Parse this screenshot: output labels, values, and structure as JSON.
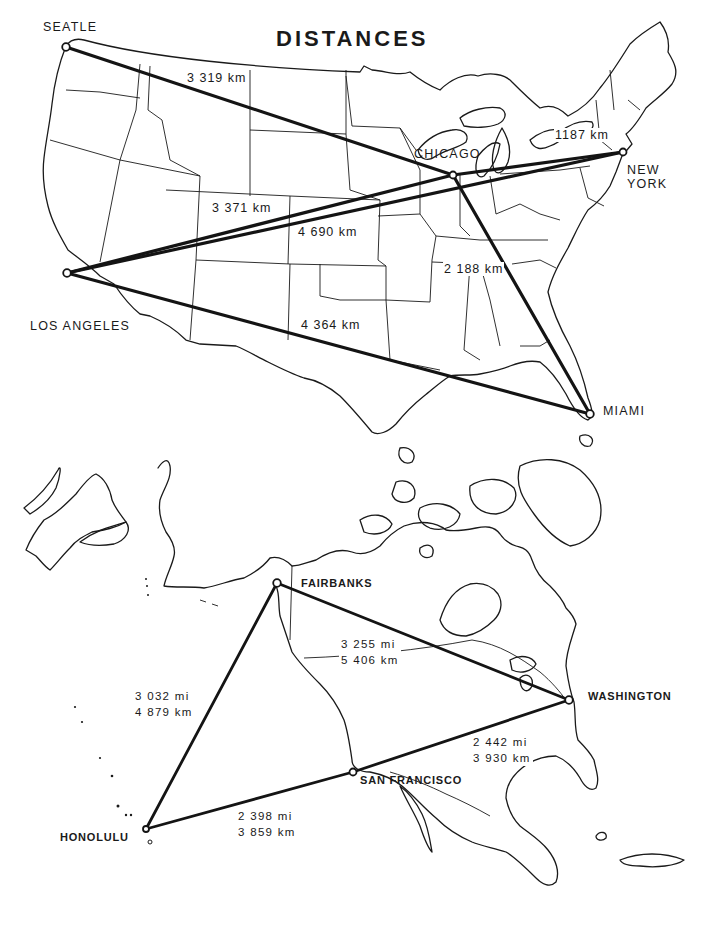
{
  "title": "DISTANCES",
  "us_map": {
    "cities": {
      "seattle": "SEATLE",
      "chicago": "CHICAGO",
      "new_york_line1": "NEW",
      "new_york_line2": "YORK",
      "los_angeles": "LOS ANGELES",
      "miami": "MIAMI"
    },
    "routes": [
      {
        "from": "Seattle",
        "to": "Chicago",
        "label": "3 319 km"
      },
      {
        "from": "Chicago",
        "to": "New York",
        "label": "1187 km"
      },
      {
        "from": "Los Angeles",
        "to": "Chicago",
        "label": "3 371 km"
      },
      {
        "from": "Los Angeles",
        "to": "New York",
        "label": "4 690 km"
      },
      {
        "from": "Chicago",
        "to": "Miami",
        "label": "2 188 km"
      },
      {
        "from": "Los Angeles",
        "to": "Miami",
        "label": "4 364 km"
      }
    ]
  },
  "north_america_map": {
    "cities": {
      "fairbanks": "FAIRBANKS",
      "washington": "WASHINGTON",
      "san_francisco": "SAN FRANCISCO",
      "honolulu": "HONOLULU"
    },
    "routes": [
      {
        "from": "Fairbanks",
        "to": "Washington",
        "mi": "3 255 mi",
        "km": "5 406 km"
      },
      {
        "from": "Fairbanks",
        "to": "Honolulu",
        "mi": "3 032 mi",
        "km": "4 879 km"
      },
      {
        "from": "San Francisco",
        "to": "Washington",
        "mi": "2 442 mi",
        "km": "3 930 km"
      },
      {
        "from": "Honolulu",
        "to": "San Francisco",
        "mi": "2 398 mi",
        "km": "3 859 km"
      }
    ]
  }
}
